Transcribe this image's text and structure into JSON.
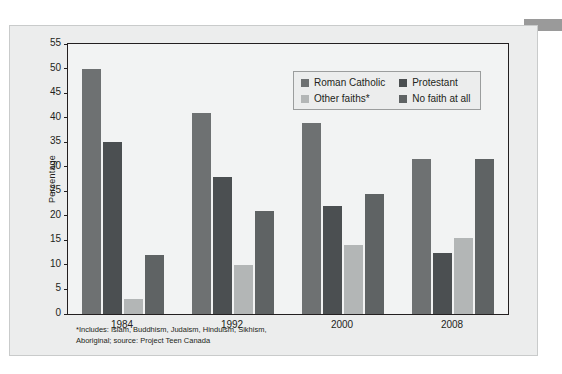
{
  "figure": {
    "y_axis_title": "Percentage",
    "footnote_line1": "*Includes: Islam, Buddhism, Judaism, Hinduism, Sikhism,",
    "footnote_line2": "Aboriginal; source: Project Teen Canada"
  },
  "chart_data": {
    "type": "bar",
    "title": "",
    "xlabel": "",
    "ylabel": "Percentage",
    "categories": [
      "1984",
      "1992",
      "2000",
      "2008"
    ],
    "series": [
      {
        "name": "Roman Catholic",
        "color": "#6e7172",
        "values": [
          50,
          41,
          39,
          31.5
        ]
      },
      {
        "name": "Protestant",
        "color": "#4b4f51",
        "values": [
          35,
          28,
          22,
          12.5
        ]
      },
      {
        "name": "Other faiths*",
        "color": "#b3b6b6",
        "values": [
          3,
          10,
          14,
          15.5
        ]
      },
      {
        "name": "No faith at all",
        "color": "#5f6364",
        "values": [
          12,
          21,
          24.5,
          31.5
        ]
      }
    ],
    "ylim": [
      0,
      55
    ],
    "yticks": [
      0,
      5,
      10,
      15,
      20,
      25,
      30,
      35,
      40,
      45,
      50,
      55
    ],
    "grid": false,
    "legend_position": "top-right-inside"
  },
  "colors": {
    "axis": "#231f20",
    "plot_background": "#f2f3f3",
    "card_background": "#eceded",
    "corner_tab": "#9a9a9a"
  }
}
